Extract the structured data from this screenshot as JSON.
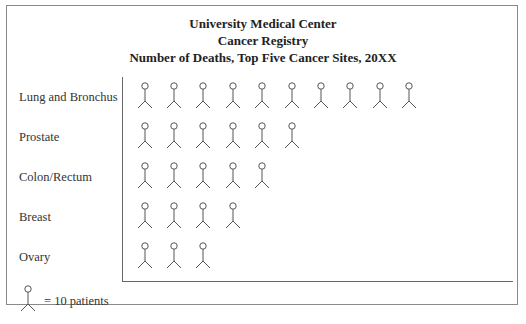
{
  "title": {
    "line1": "University Medical Center",
    "line2": "Cancer Registry",
    "line3": "Number of Deaths, Top Five Cancer Sites, 20XX"
  },
  "legend": {
    "icon": "stick-figure-icon",
    "label": "= 10 patients",
    "unit_value": 10
  },
  "rows": [
    {
      "label": "Lung and Bronchus",
      "icons": 10,
      "deaths": 100
    },
    {
      "label": "Prostate",
      "icons": 6,
      "deaths": 60
    },
    {
      "label": "Colon/Rectum",
      "icons": 5,
      "deaths": 50
    },
    {
      "label": "Breast",
      "icons": 4,
      "deaths": 40
    },
    {
      "label": "Ovary",
      "icons": 3,
      "deaths": 30
    }
  ],
  "chart_data": {
    "type": "bar",
    "subtype": "pictograph",
    "categories": [
      "Lung and Bronchus",
      "Prostate",
      "Colon/Rectum",
      "Breast",
      "Ovary"
    ],
    "values": [
      100,
      60,
      50,
      40,
      30
    ],
    "icon_counts": [
      10,
      6,
      5,
      4,
      3
    ],
    "legend": "1 stick figure = 10 patients",
    "orientation": "horizontal",
    "xlabel": "",
    "ylabel": "",
    "grid": false
  }
}
